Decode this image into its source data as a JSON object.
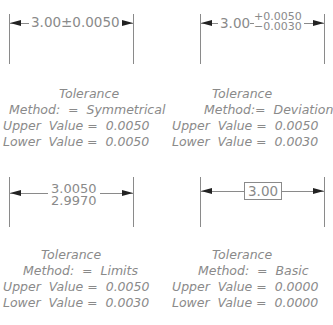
{
  "diagrams": [
    {
      "method_key": "symmetrical",
      "dimension": {
        "nominal": "3.00",
        "symbol": "±",
        "tolerance": "0.0050",
        "text": "3.00±0.0050"
      },
      "caption": {
        "title": "Tolerance",
        "method": "Method:  =  Symmetrical",
        "upper": "Upper  Value =  0.0050",
        "lower": "Lower  Value =  0.0050"
      }
    },
    {
      "method_key": "deviation",
      "dimension": {
        "nominal": "3.00",
        "upper_dev": "+0.0050",
        "lower_dev": "−0.0030"
      },
      "caption": {
        "title": "Tolerance",
        "method": "Method:=  Deviation",
        "upper": "Upper  Value =  0.0050",
        "lower": "Lower  Value =  0.0030"
      }
    },
    {
      "method_key": "limits",
      "dimension": {
        "upper_limit": "3.0050",
        "lower_limit": "2.9970"
      },
      "caption": {
        "title": "Tolerance",
        "method": "Method:  =  Limits",
        "upper": "Upper  Value =  0.0050",
        "lower": "Lower  Value =  0.0030"
      }
    },
    {
      "method_key": "basic",
      "dimension": {
        "nominal": "3.00"
      },
      "caption": {
        "title": "Tolerance",
        "method": "Method:  =  Basic",
        "upper": "Upper  Value =  0.0000",
        "lower": "Lower  Value =  0.0000"
      }
    }
  ],
  "colors": {
    "text": "#8a8a8a",
    "arrowhead": "#222222",
    "background": "#ffffff"
  }
}
